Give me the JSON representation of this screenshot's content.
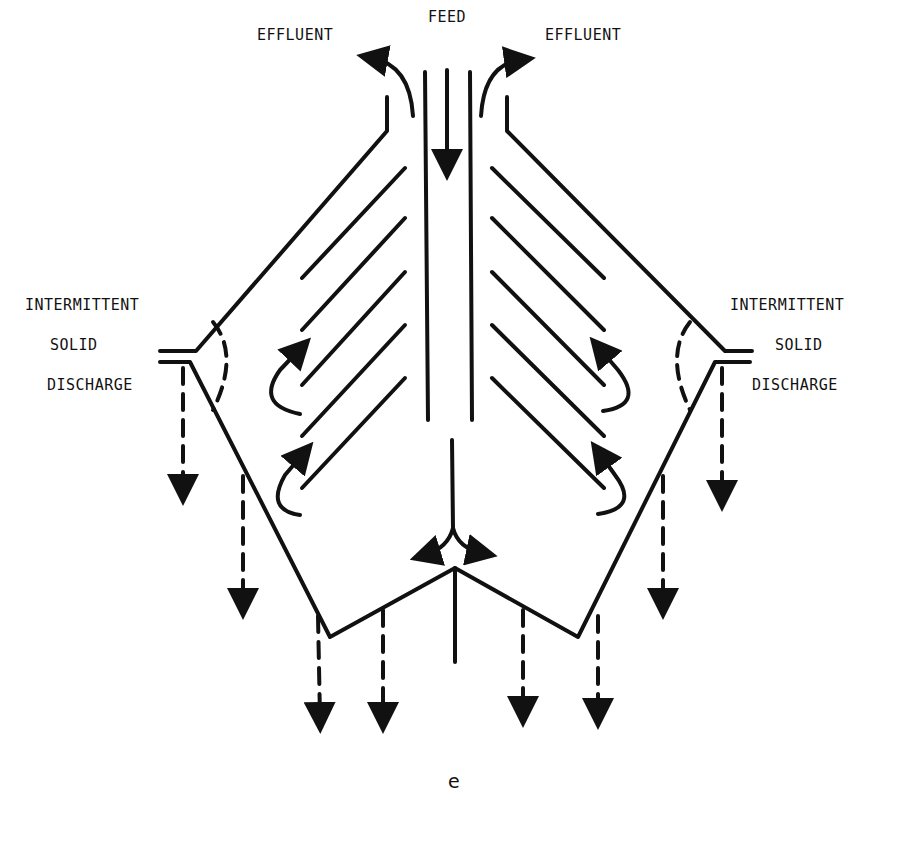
{
  "labels": {
    "feed": "FEED",
    "effluent_left": "EFFLUENT",
    "effluent_right": "EFFLUENT",
    "left_discharge": [
      "INTERMITTENT",
      "SOLID",
      "DISCHARGE"
    ],
    "right_discharge": [
      "INTERMITTENT",
      "SOLID",
      "DISCHARGE"
    ]
  },
  "caption": "e",
  "colors": {
    "ink": "#111111",
    "background": "#ffffff"
  }
}
